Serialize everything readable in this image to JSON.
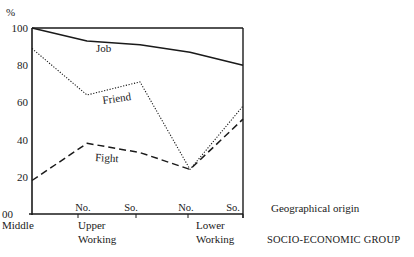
{
  "chart_data": {
    "type": "line",
    "title": "",
    "xlabel": "SOCIO-ECONOMIC GROUP",
    "xlabel_secondary": "Geographical origin",
    "ylabel": "%",
    "ylim": [
      0,
      100
    ],
    "yticks": [
      0,
      20,
      40,
      60,
      80,
      100
    ],
    "ytick_labels": [
      "00",
      "20",
      "40",
      "60",
      "80",
      "100"
    ],
    "grid": false,
    "legend": "inline labels on lines",
    "categories": [
      "Middle",
      "Upper Working No.",
      "Upper Working So.",
      "Lower Working No.",
      "Lower Working So."
    ],
    "group_labels": [
      {
        "label": "Middle",
        "lines": [
          "Middle"
        ]
      },
      {
        "label": "Upper Working",
        "lines": [
          "Upper",
          "Working"
        ]
      },
      {
        "label": "Lower Working",
        "lines": [
          "Lower",
          "Working"
        ]
      }
    ],
    "origin_labels": [
      "No.",
      "So.",
      "No.",
      "So."
    ],
    "series": [
      {
        "name": "Job",
        "style": "solid",
        "values": [
          100,
          93,
          91,
          87,
          80
        ]
      },
      {
        "name": "Friend",
        "style": "dotted",
        "values": [
          89,
          64,
          71,
          24,
          58
        ]
      },
      {
        "name": "Fight",
        "style": "dashed",
        "values": [
          18,
          38,
          33,
          24,
          51
        ]
      }
    ]
  },
  "labels": {
    "y_unit": "%",
    "geo_origin": "Geographical origin",
    "socio_group": "SOCIO-ECONOMIC GROUP"
  },
  "colors": {
    "ink": "#1a1a1a",
    "background": "#ffffff"
  }
}
